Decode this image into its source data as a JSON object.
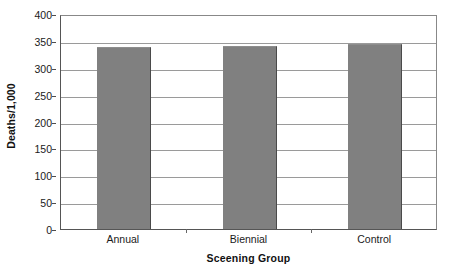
{
  "chart_data": {
    "type": "bar",
    "title": "",
    "subtitle": "",
    "categories": [
      "Annual",
      "Biennial",
      "Control"
    ],
    "values": [
      338,
      341,
      345
    ],
    "xlabel": "Sceening Group",
    "ylabel": "Deaths/1,000",
    "ylim": [
      0,
      400
    ],
    "ytick_step": 50,
    "yticks": [
      0,
      50,
      100,
      150,
      200,
      250,
      300,
      350,
      400
    ],
    "ytick_labels": [
      "0",
      "50",
      "100",
      "150",
      "200",
      "250",
      "300",
      "350",
      "400"
    ],
    "grid": "horizontal",
    "legend": "none",
    "bar_color": "#808080",
    "bar_edge_color": "#4a4a4a",
    "gridline_color": "#9a9a9a",
    "axis_color": "#555555",
    "background_color": "#ffffff",
    "annotations": []
  },
  "axes": {
    "y_title": "Deaths/1,000",
    "x_title": "Sceening Group"
  }
}
